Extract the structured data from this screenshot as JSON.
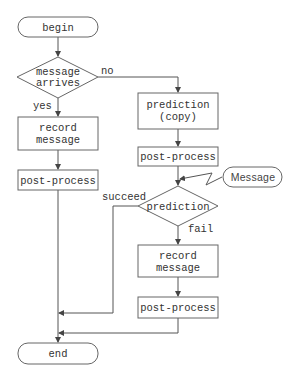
{
  "nodes": {
    "begin": {
      "label": "begin"
    },
    "message_arrives": {
      "line1": "message",
      "line2": "arrives"
    },
    "record_left": {
      "line1": "record",
      "line2": "message"
    },
    "post_left": {
      "label": "post-process"
    },
    "prediction_copy": {
      "line1": "prediction",
      "line2": "(copy)"
    },
    "post_right1": {
      "label": "post-process"
    },
    "message_event": {
      "label": "Message"
    },
    "prediction": {
      "label": "prediction"
    },
    "record_right": {
      "line1": "record",
      "line2": "message"
    },
    "post_right2": {
      "label": "post-process"
    },
    "end": {
      "label": "end"
    }
  },
  "edges": {
    "no": "no",
    "yes": "yes",
    "succeed": "succeed",
    "fail": "fail"
  },
  "colors": {
    "stroke": "#666666",
    "text": "#333333",
    "background": "#ffffff"
  }
}
